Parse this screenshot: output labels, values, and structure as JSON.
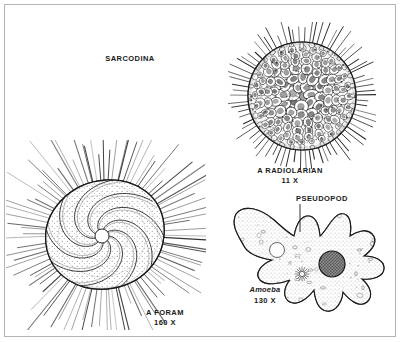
{
  "plate": {
    "title": "SARCODINA",
    "background_color": "#ffffff",
    "ink_color": "#1a1a1a",
    "border_color": "#b4b4b4"
  },
  "figures": [
    {
      "id": "radiolarian",
      "name": "A RADIOLARIAN",
      "magnification": "11 X",
      "description": "spherical lattice test covered with rounded polygonal chambers and many radiating spines"
    },
    {
      "id": "foram",
      "name": "A FORAM",
      "magnification": "160 X",
      "description": "planispiral chambered foraminiferan test with stippled cytoplasm and long radiating spines"
    },
    {
      "id": "amoeba",
      "name": "Amoeba",
      "magnification": "130 X",
      "description": "lobed amoeboid cell with granular cytoplasm, dark nucleus, contractile vacuole and star-shaped inclusion"
    }
  ],
  "callouts": [
    {
      "id": "pseudopod",
      "label": "PSEUDOPOD",
      "points_to": "amoeba"
    }
  ]
}
